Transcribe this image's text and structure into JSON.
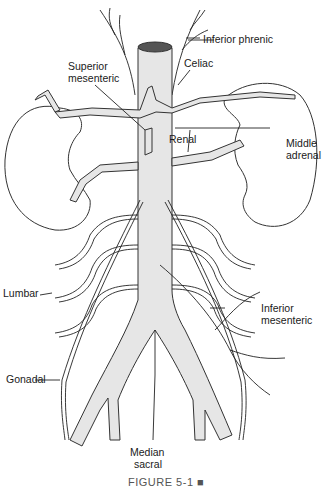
{
  "figure": {
    "caption": "FIGURE 5-1 ■",
    "colors": {
      "vessel_fill": "#e6e6e6",
      "outline": "#333333",
      "background": "#ffffff"
    }
  },
  "labels": {
    "inferior_phrenic": "Inferior phrenic",
    "superior_mesenteric": "Superior\nmesenteric",
    "superior_mesenteric_line1": "Superior",
    "superior_mesenteric_line2": "mesenteric",
    "celiac": "Celiac",
    "renal": "Renal",
    "middle_adrenal_line1": "Middle",
    "middle_adrenal_line2": "adrenal",
    "lumbar": "Lumbar",
    "inferior_mesenteric_line1": "Inferior",
    "inferior_mesenteric_line2": "mesenteric",
    "gonadal": "Gonadal",
    "median_sacral_line1": "Median",
    "median_sacral_line2": "sacral"
  }
}
